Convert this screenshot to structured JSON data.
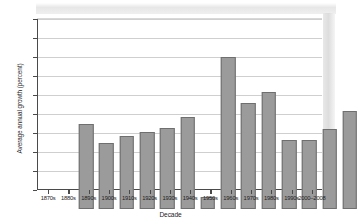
{
  "chart_data": {
    "type": "bar",
    "title": "",
    "xlabel": "Decade",
    "ylabel": "Average annual growth (percent)",
    "categories": [
      "1870s",
      "1880s",
      "1890s",
      "1900s",
      "1910s",
      "1920s",
      "1930s",
      "1940s",
      "1950s",
      "1960s",
      "1970s",
      "1980s",
      "1990s",
      "2000–2008"
    ],
    "values": [
      2.23,
      1.73,
      1.93,
      2.03,
      2.13,
      2.43,
      0.32,
      4.01,
      2.78,
      3.07,
      1.82,
      1.82,
      2.11,
      2.59
    ],
    "ylim": [
      0,
      4.5
    ],
    "ytick_values": [
      0,
      0.5,
      1.0,
      1.5,
      2.0,
      2.5,
      3.0,
      3.5,
      4.0,
      4.5
    ],
    "ytick_labels": [
      "0%",
      "0.5%",
      "1.0%",
      "1.5%",
      "2.0%",
      "2.5%",
      "3.0%",
      "3.5%",
      "4.0%",
      "4.5%"
    ],
    "grid": true,
    "legend": null,
    "bar_color": "#9b9b9b",
    "bar_edge_color": "#6f6f6f",
    "axis_color": "#4a4a4a",
    "grid_color": "#cfcfcf"
  }
}
